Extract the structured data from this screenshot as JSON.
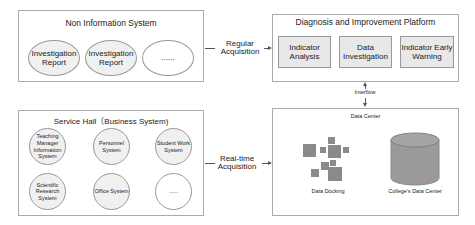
{
  "non_info_system": {
    "title": "Non Information System",
    "items": [
      "Investigation Report",
      "Investigation Report",
      "......"
    ]
  },
  "service_hall": {
    "title": "Service Hall（Business System)",
    "items": [
      "Teaching Manager Information System",
      "Personnel System",
      "Student Work System",
      "Scientific Research System",
      "Office System",
      "......"
    ]
  },
  "diagnosis_platform": {
    "title": "Diagnosis and Improvement Platform",
    "items": [
      "Indicator Analysis",
      "Data Investigation",
      "Indicator Early Warning"
    ]
  },
  "data_center": {
    "title": "Data Center",
    "docking_label": "Data Docking",
    "college_label": "College's Data Center"
  },
  "connectors": {
    "regular": "Regular Acquisition",
    "realtime": "Real-time Acquisition",
    "interflow": "Interflow"
  },
  "colors": {
    "shape_fill": "#f0f0f0",
    "block_fill": "#8a8a8a",
    "cylinder_fill": "#9a9a9a",
    "border": "#aaaaaa"
  }
}
